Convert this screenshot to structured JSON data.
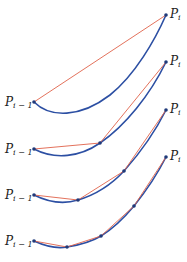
{
  "figure": {
    "colors": {
      "curve": "#2c4fa3",
      "chord": "#e0624a",
      "point": "#1f3a7a",
      "label": "#222222"
    },
    "panels": [
      {
        "start_label": "P",
        "start_sub": "i − 1",
        "end_label": "P",
        "end_sub": "i",
        "curve_path": "M34,102 C50,118 80,118 110,95 C135,75 155,40 166,15",
        "points": [
          [
            34,
            102
          ],
          [
            166,
            15
          ]
        ]
      },
      {
        "start_label": "P",
        "start_sub": "i − 1",
        "end_label": "P",
        "end_sub": "i",
        "curve_path": "M34,149 C55,160 80,157 100,143 C125,126 150,95 166,62",
        "points": [
          [
            34,
            149
          ],
          [
            100,
            143
          ],
          [
            166,
            62
          ]
        ]
      },
      {
        "start_label": "P",
        "start_sub": "i − 1",
        "end_label": "P",
        "end_sub": "i",
        "curve_path": "M34,195 C50,203 65,204 78,200 C98,194 112,184 124,171 C140,153 155,132 166,110",
        "points": [
          [
            34,
            195
          ],
          [
            78,
            200
          ],
          [
            124,
            171
          ],
          [
            166,
            110
          ]
        ]
      },
      {
        "start_label": "P",
        "start_sub": "i − 1",
        "end_label": "P",
        "end_sub": "i",
        "curve_path": "M34,241 C45,246 56,249 67,247 C80,245 91,242 101,236 C114,228 124,218 134,206 C146,191 157,175 166,157",
        "points": [
          [
            34,
            241
          ],
          [
            67,
            247
          ],
          [
            101,
            236
          ],
          [
            134,
            206
          ],
          [
            166,
            157
          ]
        ]
      }
    ]
  }
}
